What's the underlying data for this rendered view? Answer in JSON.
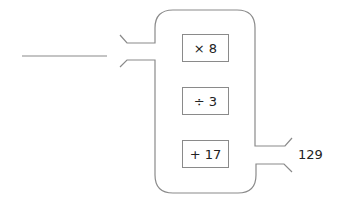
{
  "diagram": {
    "type": "function machine",
    "input_value": "",
    "operations": [
      "× 8",
      "÷ 3",
      "+ 17"
    ],
    "output_value": "129",
    "line_color": "#8a8a8a"
  }
}
